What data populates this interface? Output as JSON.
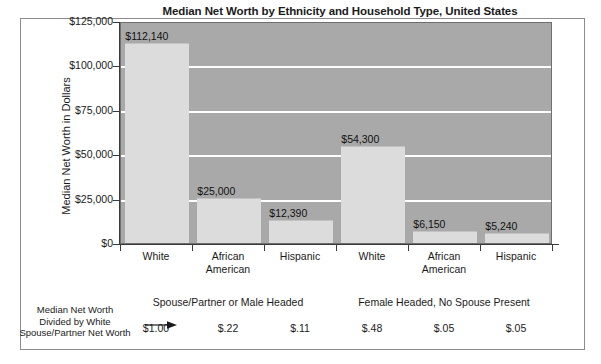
{
  "chart_data": {
    "type": "bar",
    "title": "Median Net Worth by Ethnicity and Household Type, United States",
    "xlabel": "",
    "ylabel": "Median Net Worth in Dollars",
    "ylim": [
      0,
      125000
    ],
    "grid": true,
    "legend": "none",
    "categories": [
      "White",
      "African American",
      "Hispanic",
      "White",
      "African American",
      "Hispanic"
    ],
    "category_lines": [
      [
        "White"
      ],
      [
        "African",
        "American"
      ],
      [
        "Hispanic"
      ],
      [
        "White"
      ],
      [
        "African",
        "American"
      ],
      [
        "Hispanic"
      ]
    ],
    "values": [
      112140,
      25000,
      12390,
      54300,
      6150,
      5240
    ],
    "value_labels": [
      "$112,140",
      "$25,000",
      "$12,390",
      "$54,300",
      "$6,150",
      "$5,240"
    ],
    "y_ticks": [
      0,
      25000,
      50000,
      75000,
      100000,
      125000
    ],
    "y_tick_labels": [
      "$0",
      "$25,000",
      "$50,000",
      "$75,000",
      "$100,000",
      "$125,000"
    ],
    "groups": [
      {
        "label": "Spouse/Partner or Male Headed",
        "span": 3
      },
      {
        "label": "Female Headed, No Spouse Present",
        "span": 3
      }
    ],
    "ratio_row": {
      "caption_lines": [
        "Median Net Worth",
        "Divided by White",
        "Spouse/Partner Net Worth"
      ],
      "values": [
        "$1.00",
        "$.22",
        "$.11",
        "$.48",
        "$.05",
        "$.05"
      ]
    },
    "colors": {
      "bar_fill": "#dcdcdc",
      "plot_background": "#a9a9a9",
      "gridline": "#ffffff",
      "axis": "#3a3a3a",
      "frame": "#8c8c8c",
      "text": "#1a1a1a"
    }
  }
}
